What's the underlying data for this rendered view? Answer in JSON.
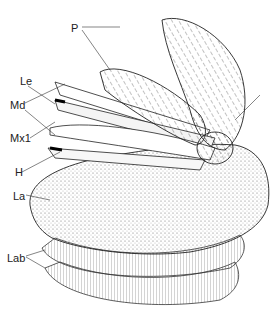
{
  "diagram": {
    "labels": [
      {
        "id": "P",
        "text": "P",
        "x": 71,
        "y": 23
      },
      {
        "id": "Le",
        "text": "Le",
        "x": 20,
        "y": 76
      },
      {
        "id": "Md",
        "text": "Md",
        "x": 10,
        "y": 100
      },
      {
        "id": "Mx1",
        "text": "Mx1",
        "x": 10,
        "y": 133
      },
      {
        "id": "H",
        "text": "H",
        "x": 15,
        "y": 167
      },
      {
        "id": "La",
        "text": "La",
        "x": 13,
        "y": 191
      },
      {
        "id": "Lab",
        "text": "Lab",
        "x": 7,
        "y": 253
      }
    ]
  }
}
